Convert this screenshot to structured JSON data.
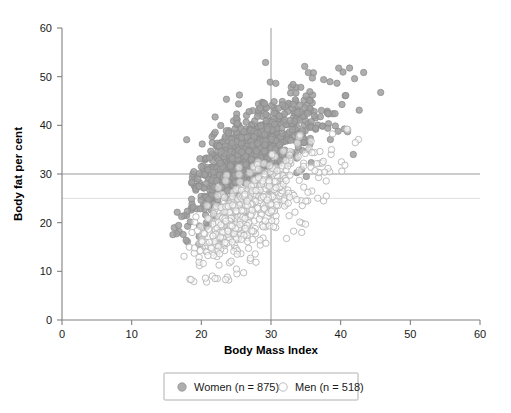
{
  "chart_data": {
    "type": "scatter",
    "title": "",
    "xlabel": "Body Mass Index",
    "ylabel": "Body fat per cent",
    "xlim": [
      0,
      60
    ],
    "ylim": [
      0,
      60
    ],
    "xticks": [
      0,
      10,
      20,
      30,
      40,
      50,
      60
    ],
    "yticks": [
      0,
      10,
      20,
      30,
      40,
      50,
      60
    ],
    "xtick_labels": [
      "0",
      "10",
      "20",
      "30",
      "40",
      "50",
      "60"
    ],
    "ytick_labels": [
      "0",
      "10",
      "20",
      "30",
      "40",
      "50",
      "60"
    ],
    "grid": false,
    "legend_position": "bottom-center",
    "reference_lines": [
      {
        "name": "bodyfat-30-line",
        "orientation": "horizontal",
        "value": 30,
        "color": "#9a9a9a",
        "style": "solid"
      },
      {
        "name": "bodyfat-25-line",
        "orientation": "horizontal",
        "value": 25,
        "color": "#dedee3",
        "style": "solid"
      },
      {
        "name": "bmi-30-line",
        "orientation": "vertical",
        "value": 30,
        "color": "#9a9a9a",
        "style": "solid"
      }
    ],
    "series": [
      {
        "name": "Women",
        "legend_label": "Women (n = 875)",
        "count": 875,
        "marker": "filled-circle",
        "color": "#a0a0a0",
        "edge_color": "#8a8a8a",
        "x_range": [
          15.0,
          47.5
        ],
        "y_range": [
          12.0,
          56.0
        ],
        "x_mean": 27.6,
        "y_mean": 34.5,
        "x_sd": 5.2,
        "y_sd": 6.6,
        "correlation": 0.74
      },
      {
        "name": "Men",
        "legend_label": "Men (n = 518)",
        "count": 518,
        "marker": "open-circle",
        "color": "#ffffff",
        "edge_color": "#b6b6b6",
        "x_range": [
          17.0,
          54.0
        ],
        "y_range": [
          7.0,
          43.0
        ],
        "x_mean": 27.0,
        "y_mean": 22.5,
        "x_sd": 4.4,
        "y_sd": 6.2,
        "correlation": 0.74
      }
    ]
  },
  "axes": {
    "x_title": "Body Mass Index",
    "y_title": "Body fat per cent"
  },
  "legend": {
    "women_label": "Women (n = 875)",
    "men_label": "Men (n = 518)"
  }
}
